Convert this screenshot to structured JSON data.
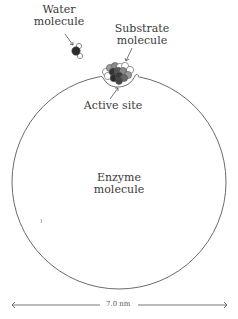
{
  "diagram": {
    "labels": {
      "water": [
        "Water",
        "molecule"
      ],
      "substrate": [
        "Substrate",
        "molecule"
      ],
      "active_site": "Active site",
      "enzyme": [
        "Enzyme",
        "molecule"
      ]
    },
    "scale_bar": {
      "label": "7.0 nm"
    },
    "colors": {
      "outline": "#6b6b6b",
      "text": "#3a3a3a",
      "dark_atom": "#2b2b2b",
      "mid_atom": "#7a7a7a",
      "light_atom": "#ffffff"
    }
  }
}
